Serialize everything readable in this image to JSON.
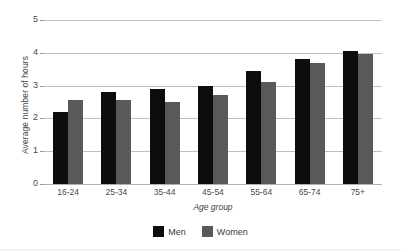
{
  "chart_data": {
    "type": "bar",
    "title": "",
    "subtitle": "",
    "xlabel": "Age group",
    "ylabel": "Average number of hours",
    "categories": [
      "16-24",
      "25-34",
      "35-44",
      "45-54",
      "55-64",
      "65-74",
      "75+"
    ],
    "series": [
      {
        "name": "Men",
        "color": "#0d0d0d",
        "values": [
          2.2,
          2.8,
          2.9,
          3.0,
          3.45,
          3.8,
          4.05
        ]
      },
      {
        "name": "Women",
        "color": "#595959",
        "values": [
          2.55,
          2.55,
          2.5,
          2.7,
          3.1,
          3.7,
          3.95
        ]
      }
    ],
    "ylim": [
      0,
      5
    ],
    "yticks": [
      0,
      1,
      2,
      3,
      4,
      5
    ],
    "ytick_labels": [
      "0",
      "1",
      "2",
      "3",
      "4",
      "5"
    ],
    "grid": true,
    "grid_axis": "y",
    "legend_position": "bottom",
    "orientation": "vertical"
  },
  "axes": {
    "y_title": "Average number of hours",
    "x_title": "Age group"
  },
  "legend": {
    "items": [
      {
        "label": "Men",
        "swatch": "men-swatch"
      },
      {
        "label": "Women",
        "swatch": "women-swatch"
      }
    ]
  },
  "colors": {
    "men": "#0d0d0d",
    "women": "#595959",
    "gridline": "#bfbfbf",
    "text": "#3a3a3a",
    "background": "#ffffff"
  }
}
